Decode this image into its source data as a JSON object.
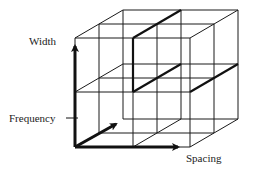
{
  "diagram": {
    "type": "3d-grid-cube",
    "axes": [
      {
        "name": "width",
        "label": "Width",
        "direction": "vertical"
      },
      {
        "name": "frequency",
        "label": "Frequency",
        "direction": "depth"
      },
      {
        "name": "spacing",
        "label": "Spacing",
        "direction": "horizontal"
      }
    ],
    "grid": {
      "columns": 2,
      "rows": 2,
      "depth_layers": 2
    },
    "colors": {
      "line": "#1a1a1a",
      "background": "#ffffff"
    }
  }
}
